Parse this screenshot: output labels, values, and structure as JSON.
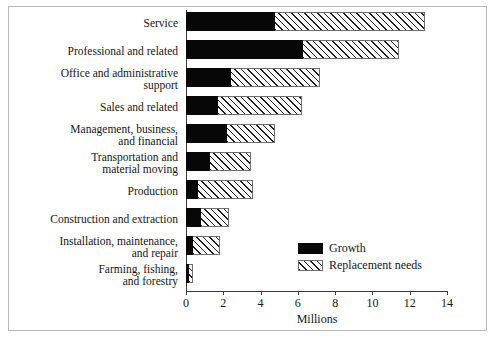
{
  "figure": {
    "frame_color": "#b9b9b9",
    "background": "#ffffff"
  },
  "chart_data": {
    "type": "bar",
    "orientation": "horizontal",
    "stacked": true,
    "title": "",
    "xlabel": "Millions",
    "ylabel": "",
    "xlim": [
      0,
      14
    ],
    "xticks": [
      0,
      2,
      4,
      6,
      8,
      10,
      12,
      14
    ],
    "xtick_labels": [
      "0",
      "2",
      "4",
      "6",
      "8",
      "10",
      "12",
      "14"
    ],
    "grid": false,
    "legend_position": "center-right",
    "categories": [
      "Service",
      "Professional and related",
      "Office and administrative\nsupport",
      "Sales and related",
      "Management, business,\nand financial",
      "Transportation and\nmaterial moving",
      "Production",
      "Construction and extraction",
      "Installation, maintenance,\nand repair",
      "Farming, fishing,\nand forestry"
    ],
    "series": [
      {
        "name": "Growth",
        "color": "#070707",
        "pattern": "solid",
        "values": [
          4.8,
          6.3,
          2.4,
          1.7,
          2.2,
          1.3,
          0.65,
          0.8,
          0.4,
          0.15
        ]
      },
      {
        "name": "Replacement needs",
        "color": "#ffffff",
        "pattern": "diagonal-hatch",
        "values": [
          8.0,
          5.1,
          4.8,
          4.5,
          2.6,
          2.2,
          2.95,
          1.5,
          1.4,
          0.2
        ]
      }
    ],
    "totals": [
      12.8,
      11.4,
      7.2,
      6.2,
      4.8,
      3.5,
      3.6,
      2.3,
      1.8,
      0.35
    ]
  },
  "legend": {
    "items": [
      {
        "label": "Growth",
        "swatch": "solid-black-swatch"
      },
      {
        "label": "Replacement needs",
        "swatch": "hatched-swatch"
      }
    ]
  }
}
